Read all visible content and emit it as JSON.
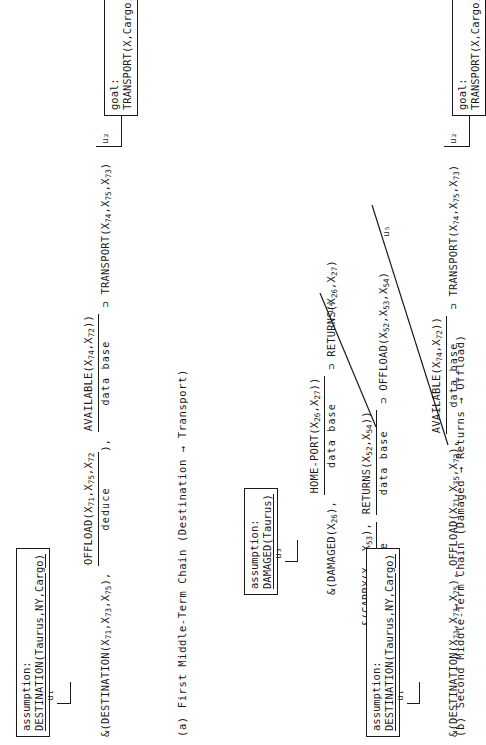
{
  "figure": {
    "orientation": "rotated-90-ccw",
    "ink_color": "#1a1a1a",
    "background": "#ffffff"
  },
  "panel_a": {
    "caption_id": "(a)",
    "caption_text": "First Middle-Term Chain (Destination → Transport)",
    "assumption_box": {
      "name": "assumption-box-destination",
      "tag": "assumption:",
      "claim": "DESTINATION(Taurus,NY,Cargo)"
    },
    "goal_box": {
      "name": "goal-box-transport",
      "tag": "goal:",
      "claim": "TRANSPORT(X,Cargo,NY)"
    },
    "link_u1": "u₁",
    "link_u2": "u₂",
    "clause": {
      "prefix": "&(DESTINATION(X",
      "full_text": "&(DESTINATION(X71,X73,X75), OFFLOAD(X71,X75,X72), AVAILABLE(X74,X72)) ⊃ TRANSPORT(X74,X75,X73)",
      "segments": [
        {
          "text": "&(DESTINATION(X",
          "sub": "71",
          "justification": null
        },
        {
          "text": ",X",
          "sub": "73",
          "justification": null
        },
        {
          "text": ",X",
          "sub": "75",
          "justification": null
        },
        {
          "text": "), ",
          "sub": null,
          "justification": null
        }
      ],
      "atom1": "&(DESTINATION(X₇71₇,X₇73₇,X₇75₇),",
      "atom2_numerator": "OFFLOAD(X71,X75,X72)",
      "atom2_denominator": "deduce",
      "atom3_numerator": "AVAILABLE(X74,X72))",
      "atom3_denominator": "data base",
      "consequent": "⊃ TRANSPORT(X74,X75,X73)"
    }
  },
  "panel_b": {
    "caption_id": "(b)",
    "caption_text": "Second Middle-Term Chain (Damaged → Returns → Offload)",
    "assumption_box": {
      "name": "assumption-box-damaged",
      "tag": "assumption:",
      "claim": "DAMAGED(Taurus)"
    },
    "assumption_box_2": {
      "name": "assumption-box-destination-2",
      "tag": "assumption:",
      "claim": "DESTINATION(Taurus,NY,Cargo)"
    },
    "goal_box": {
      "name": "goal-box-transport-2",
      "tag": "goal:",
      "claim": "TRANSPORT(X,Cargo,NY)"
    },
    "link_u3": "u₃",
    "link_u4": "u₄",
    "link_u5": "u₅",
    "link_u1": "u₁",
    "link_u2": "u₂",
    "row1": {
      "antecedent_atom": "&(DAMAGED(X26),",
      "frac_numerator": "HOME-PORT(X26,X27))",
      "frac_denominator": "data base",
      "consequent": "⊃ RETURNS(X26,X27)"
    },
    "row2": {
      "antecedent_frac_numerator": "&(CARRY(X52,X53),",
      "antecedent_frac_denominator": "data base",
      "frac2_numerator": "RETURNS(X52,X54))",
      "frac2_denominator": "data base",
      "consequent": "⊃ OFFLOAD(X52,X53,X54)"
    },
    "row3": {
      "antecedent_atom": "&(DESTINATION(X71,X73,X75),",
      "frac_numerator": "OFFLOAD(X71,X75,X72)",
      "frac_denominator": "",
      "frac2_numerator": "AVAILABLE(X74,X72))",
      "frac2_denominator": "data base",
      "consequent": "⊃ TRANSPORT(X74,X75,X73)"
    }
  },
  "labels": {
    "deduce": "deduce",
    "data_base": "data base"
  }
}
